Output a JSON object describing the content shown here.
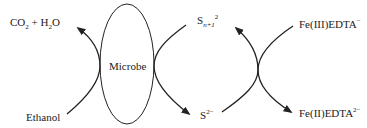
{
  "diagram": {
    "center_label": "Microbe",
    "labels": {
      "co2_h2o": {
        "a": "CO",
        "a_sub": "2",
        "b": " + H",
        "b_sub": "2",
        "c": "O"
      },
      "ethanol": "Ethanol",
      "polysulfide": {
        "base": "S",
        "sub": "n+1",
        "sup": "2"
      },
      "sulfide": {
        "base": "S",
        "sup": "2−"
      },
      "fe3": {
        "base": "Fe(III)EDTA",
        "sup": "−"
      },
      "fe2": {
        "base": "Fe(II)EDTA",
        "sup": "2−"
      }
    },
    "colors": {
      "stroke": "#222222",
      "text": "#222222",
      "background": "#ffffff"
    }
  }
}
